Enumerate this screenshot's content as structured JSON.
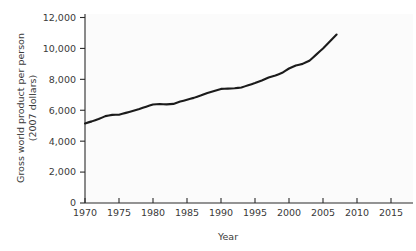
{
  "chart_data": {
    "type": "line",
    "title": "",
    "xlabel": "Year",
    "ylabel": "Gross world product per person (2007 dollars)",
    "ylabel_line1": "Gross world product per person",
    "ylabel_line2": "(2007 dollars)",
    "xlim": [
      1970,
      2015
    ],
    "ylim": [
      0,
      12000
    ],
    "grid": false,
    "legend": null,
    "xticks": [
      1970,
      1975,
      1980,
      1985,
      1990,
      1995,
      2000,
      2005,
      2010,
      2015
    ],
    "xtick_labels": [
      "1970",
      "1975",
      "1980",
      "1985",
      "1990",
      "1995",
      "2000",
      "2005",
      "2010",
      "2015"
    ],
    "yticks": [
      0,
      2000,
      4000,
      6000,
      8000,
      10000,
      12000
    ],
    "ytick_labels": [
      "0",
      "2,000",
      "4,000",
      "6,000",
      "8,000",
      "10,000",
      "12,000"
    ],
    "series": [
      {
        "name": "Gross world product per person",
        "color": "#1b1b1b",
        "x": [
          1970,
          1971,
          1972,
          1973,
          1974,
          1975,
          1976,
          1977,
          1978,
          1979,
          1980,
          1981,
          1982,
          1983,
          1984,
          1985,
          1986,
          1987,
          1988,
          1989,
          1990,
          1991,
          1992,
          1993,
          1994,
          1995,
          1996,
          1997,
          1998,
          1999,
          2000,
          2001,
          2002,
          2003,
          2004,
          2005,
          2006,
          2007
        ],
        "values": [
          5150,
          5280,
          5430,
          5620,
          5700,
          5710,
          5830,
          5950,
          6080,
          6230,
          6370,
          6400,
          6380,
          6410,
          6560,
          6680,
          6800,
          6950,
          7120,
          7250,
          7380,
          7400,
          7420,
          7470,
          7620,
          7760,
          7930,
          8120,
          8250,
          8420,
          8700,
          8900,
          9000,
          9200,
          9600,
          10000,
          10450,
          10900
        ]
      }
    ],
    "annotations": []
  },
  "axis": {
    "x_axis_title": "Year",
    "y_axis_title_line1": "Gross world product per person",
    "y_axis_title_line2": "(2007 dollars)"
  },
  "colors": {
    "line": "#1b1b1b",
    "axis": "#2b2b2b",
    "text": "#3a3a3a",
    "background": "#ffffff",
    "plot_background": "#fbfbfb"
  }
}
